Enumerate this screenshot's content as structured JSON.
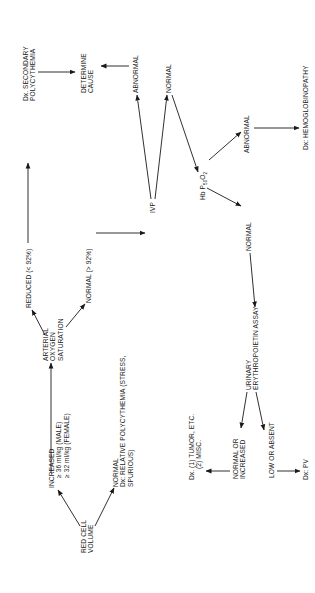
{
  "diagram": {
    "orientation": "rotated 90° counter-clockwise (landscape page)",
    "nodes": {
      "red_cell_volume": {
        "lines": [
          "RED CELL",
          "VOLUME"
        ]
      },
      "increased": {
        "lines": [
          "INCREASED",
          "≥ 36 ml/kg (MALE)",
          "≥ 32 ml/kg (FEMALE)"
        ]
      },
      "normal_relative": {
        "lines": [
          "NORMAL",
          "Dx: RELATIVE POLYCYTHEMIA (STRESS,",
          "SPURIOUS)"
        ]
      },
      "arterial_o2": {
        "lines": [
          "ARTERIAL",
          "OXYGEN",
          "SATURATION"
        ]
      },
      "reduced": {
        "lines": [
          "REDUCED (< 92%)"
        ]
      },
      "normal_o2": {
        "lines": [
          "NORMAL (> 92%)"
        ]
      },
      "dx_secondary": {
        "lines": [
          "Dx. SECONDARY",
          "POLYCYTHEMIA"
        ]
      },
      "determine_cause": {
        "lines": [
          "DETERMINE",
          "CAUSE"
        ]
      },
      "ivp": {
        "lines": [
          "IVP"
        ]
      },
      "ivp_abnormal": {
        "lines": [
          "ABNORMAL"
        ]
      },
      "ivp_normal": {
        "lines": [
          "NORMAL"
        ]
      },
      "hb_p50": {
        "prefix": "Hb P",
        "subscript": "50",
        "suffix": "O",
        "suffix_sub": "2"
      },
      "hb_abnormal": {
        "lines": [
          "ABNORMAL"
        ]
      },
      "dx_hemoglobinopathy": {
        "lines": [
          "Dx: HEMOGLOBINOPATHY"
        ]
      },
      "hb_normal": {
        "lines": [
          "NORMAL"
        ]
      },
      "urinary_epo": {
        "lines": [
          "URINARY",
          "ERYTHROPOIETIN ASSAY"
        ]
      },
      "normal_or_increased": {
        "lines": [
          "NORMAL OR",
          "INCREASED"
        ]
      },
      "dx_tumor": {
        "lines": [
          "Dx. (1) TUMOR, ETC.",
          "(2) MISC."
        ]
      },
      "low_or_absent": {
        "lines": [
          "LOW OR ABSENT"
        ]
      },
      "dx_pv": {
        "lines": [
          "Dx: PV"
        ]
      }
    },
    "edges": [
      [
        "red_cell_volume",
        "increased"
      ],
      [
        "red_cell_volume",
        "normal_relative"
      ],
      [
        "increased",
        "arterial_o2"
      ],
      [
        "arterial_o2",
        "reduced"
      ],
      [
        "arterial_o2",
        "normal_o2"
      ],
      [
        "reduced",
        "dx_secondary"
      ],
      [
        "dx_secondary",
        "determine_cause"
      ],
      [
        "normal_o2",
        "ivp"
      ],
      [
        "ivp",
        "ivp_abnormal"
      ],
      [
        "ivp_abnormal",
        "determine_cause"
      ],
      [
        "ivp",
        "ivp_normal"
      ],
      [
        "ivp_normal",
        "hb_p50"
      ],
      [
        "hb_p50",
        "hb_abnormal"
      ],
      [
        "hb_abnormal",
        "dx_hemoglobinopathy"
      ],
      [
        "hb_p50",
        "hb_normal"
      ],
      [
        "hb_normal",
        "urinary_epo"
      ],
      [
        "urinary_epo",
        "normal_or_increased"
      ],
      [
        "urinary_epo",
        "low_or_absent"
      ],
      [
        "normal_or_increased",
        "dx_tumor"
      ],
      [
        "low_or_absent",
        "dx_pv"
      ]
    ],
    "colors": {
      "ink": "#1a1a1a",
      "background": "#ffffff"
    }
  }
}
